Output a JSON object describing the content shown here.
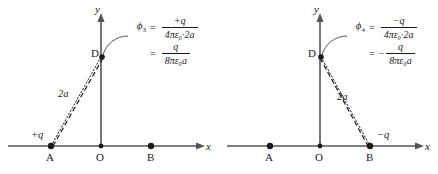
{
  "figure": {
    "background_color": "#ffffff",
    "ink_color": "#1a1a1a",
    "axis_color": "#555555"
  },
  "panels": [
    {
      "id": "left",
      "name": "potential-at-D-from-positive-charge",
      "axes": {
        "x_label": "x",
        "y_label": "y"
      },
      "points": [
        {
          "key": "A",
          "label": "A",
          "charge_label": "+q",
          "has_charge": true
        },
        {
          "key": "O",
          "label": "O",
          "charge_label": "",
          "has_charge": false
        },
        {
          "key": "B",
          "label": "B",
          "charge_label": "",
          "has_charge": false
        },
        {
          "key": "D",
          "label": "D",
          "charge_label": "",
          "has_charge": false
        }
      ],
      "distance_label": "2a",
      "connector_from": "A",
      "connector_to": "D",
      "formula": {
        "symbol": "ϕ",
        "subscript": "3",
        "line1": {
          "equals": "=",
          "sign_prefix": "",
          "numerator": "+q",
          "denominator": "4πε₀·2a"
        },
        "line2": {
          "equals": "=",
          "sign_prefix": "",
          "numerator": "q",
          "denominator": "8πε₀a"
        }
      }
    },
    {
      "id": "right",
      "name": "potential-at-D-from-negative-charge",
      "axes": {
        "x_label": "x",
        "y_label": "y"
      },
      "points": [
        {
          "key": "A",
          "label": "A",
          "charge_label": "",
          "has_charge": true
        },
        {
          "key": "O",
          "label": "O",
          "charge_label": "",
          "has_charge": false
        },
        {
          "key": "B",
          "label": "B",
          "charge_label": "−q",
          "has_charge": true
        },
        {
          "key": "D",
          "label": "D",
          "charge_label": "",
          "has_charge": false
        }
      ],
      "distance_label": "2a",
      "connector_from": "D",
      "connector_to": "B",
      "formula": {
        "symbol": "ϕ",
        "subscript": "4",
        "line1": {
          "equals": "=",
          "sign_prefix": "",
          "numerator": "−q",
          "denominator": "4πε₀·2a"
        },
        "line2": {
          "equals": "=",
          "sign_prefix": "−",
          "numerator": "q",
          "denominator": "8πε₀a"
        }
      }
    }
  ]
}
